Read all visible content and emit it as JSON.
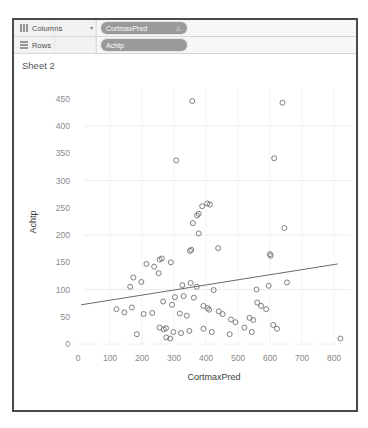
{
  "window": {
    "sheet_title": "Sheet 2"
  },
  "shelves": [
    {
      "name": "columns",
      "label": "Columns",
      "glyph": "columns-icon",
      "caret": "▾",
      "pill": {
        "text": "CortmaxPred",
        "sort_glyph": "△"
      }
    },
    {
      "name": "rows",
      "label": "Rows",
      "glyph": "rows-icon",
      "caret": "",
      "pill": {
        "text": "Achtp",
        "sort_glyph": ""
      }
    }
  ],
  "chart_data": {
    "type": "scatter",
    "title": "Sheet 2",
    "xlabel": "CortmaxPred",
    "ylabel": "Achtp",
    "xlim": [
      0,
      850
    ],
    "ylim": [
      0,
      470
    ],
    "xticks": [
      0,
      100,
      200,
      300,
      400,
      500,
      600,
      700,
      800
    ],
    "yticks": [
      0,
      50,
      100,
      150,
      200,
      250,
      300,
      350,
      400,
      450
    ],
    "grid": true,
    "legend": "none",
    "marker": "open-circle",
    "marker_color": "#707070",
    "trendline": {
      "show": true,
      "color": "#6b6b6b",
      "x_start": 10,
      "y_start": 72,
      "x_end": 812,
      "y_end": 147
    },
    "points": [
      [
        357,
        446
      ],
      [
        639,
        443
      ],
      [
        307,
        337
      ],
      [
        613,
        341
      ],
      [
        388,
        253
      ],
      [
        412,
        256
      ],
      [
        404,
        258
      ],
      [
        377,
        239
      ],
      [
        372,
        236
      ],
      [
        359,
        222
      ],
      [
        645,
        213
      ],
      [
        377,
        203
      ],
      [
        438,
        176
      ],
      [
        354,
        173
      ],
      [
        350,
        171
      ],
      [
        600,
        165
      ],
      [
        602,
        162
      ],
      [
        262,
        157
      ],
      [
        255,
        155
      ],
      [
        290,
        150
      ],
      [
        214,
        147
      ],
      [
        238,
        142
      ],
      [
        173,
        122
      ],
      [
        198,
        114
      ],
      [
        252,
        130
      ],
      [
        163,
        105
      ],
      [
        326,
        108
      ],
      [
        352,
        112
      ],
      [
        371,
        105
      ],
      [
        424,
        99
      ],
      [
        558,
        100
      ],
      [
        596,
        107
      ],
      [
        653,
        113
      ],
      [
        303,
        86
      ],
      [
        330,
        88
      ],
      [
        362,
        85
      ],
      [
        266,
        78
      ],
      [
        294,
        72
      ],
      [
        120,
        64
      ],
      [
        145,
        58
      ],
      [
        168,
        67
      ],
      [
        205,
        55
      ],
      [
        232,
        57
      ],
      [
        392,
        70
      ],
      [
        405,
        66
      ],
      [
        410,
        63
      ],
      [
        440,
        60
      ],
      [
        452,
        55
      ],
      [
        560,
        76
      ],
      [
        572,
        70
      ],
      [
        588,
        64
      ],
      [
        536,
        48
      ],
      [
        548,
        44
      ],
      [
        255,
        30
      ],
      [
        268,
        27
      ],
      [
        275,
        29
      ],
      [
        298,
        22
      ],
      [
        322,
        20
      ],
      [
        348,
        24
      ],
      [
        392,
        28
      ],
      [
        418,
        22
      ],
      [
        474,
        18
      ],
      [
        520,
        30
      ],
      [
        543,
        22
      ],
      [
        610,
        35
      ],
      [
        622,
        28
      ],
      [
        820,
        10
      ],
      [
        276,
        12
      ],
      [
        288,
        10
      ],
      [
        184,
        18
      ],
      [
        478,
        45
      ],
      [
        492,
        40
      ],
      [
        318,
        56
      ],
      [
        340,
        52
      ]
    ]
  }
}
